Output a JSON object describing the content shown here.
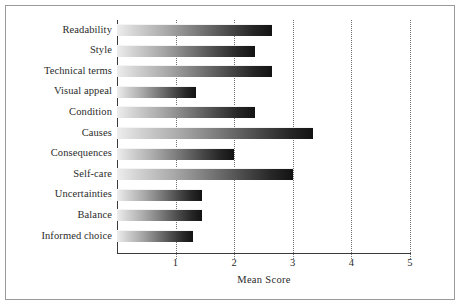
{
  "figure": {
    "border_color": "#9a9a9a",
    "background": "#ffffff"
  },
  "axis": {
    "x_label": "Mean Score",
    "x_ticks": [
      "1",
      "2",
      "3",
      "4",
      "5"
    ],
    "x_tick_values": [
      1,
      2,
      3,
      4,
      5
    ],
    "x_min": 0,
    "x_max": 5,
    "grid": "vertical-dotted"
  },
  "categories": [
    "Readability",
    "Style",
    "Technical terms",
    "Visual appeal",
    "Condition",
    "Causes",
    "Consequences",
    "Self-care",
    "Uncertainties",
    "Balance",
    "Informed choice"
  ],
  "chart_data": {
    "type": "bar",
    "orientation": "horizontal",
    "title": "",
    "subtitle": "",
    "xlabel": "Mean Score",
    "ylabel": "",
    "xlim": [
      0,
      5
    ],
    "xticks": [
      1,
      2,
      3,
      4,
      5
    ],
    "grid": true,
    "legend": false,
    "legend_position": "none",
    "categories": [
      "Readability",
      "Style",
      "Technical terms",
      "Visual appeal",
      "Condition",
      "Causes",
      "Consequences",
      "Self-care",
      "Uncertainties",
      "Balance",
      "Informed choice"
    ],
    "values": [
      2.65,
      2.35,
      2.65,
      1.35,
      2.35,
      3.35,
      2.0,
      3.0,
      1.45,
      1.45,
      1.3
    ],
    "bar_style": "horizontal-gradient-light-to-dark",
    "bar_gradient": [
      "#ededed",
      "#131313"
    ]
  }
}
